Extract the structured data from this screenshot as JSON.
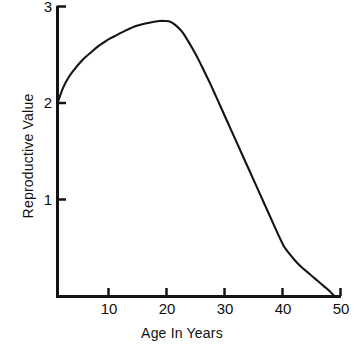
{
  "chart_data": {
    "type": "line",
    "title": "",
    "xlabel": "Age In Years",
    "ylabel": "Reproductive Value",
    "xlim": [
      0,
      50
    ],
    "ylim": [
      0,
      3
    ],
    "xticks": [
      10,
      20,
      30,
      40,
      50
    ],
    "xtick_labels": [
      "10",
      "20",
      "30",
      "40",
      "50"
    ],
    "yticks": [
      1,
      2,
      3
    ],
    "ytick_labels": [
      "1",
      "2",
      "3"
    ],
    "grid": false,
    "legend": null,
    "line_color": "#141414",
    "series": [
      {
        "name": "Reproductive Value",
        "x": [
          0,
          1,
          2,
          3,
          4,
          5,
          6,
          7,
          8,
          9,
          10,
          12,
          14,
          16,
          18,
          19,
          20,
          21,
          22,
          23,
          24,
          25,
          26,
          27,
          28,
          29,
          30,
          31,
          32,
          33,
          34,
          35,
          36,
          37,
          38,
          39,
          40,
          41,
          42,
          43,
          44,
          45,
          46,
          47,
          48,
          49
        ],
        "y": [
          2.0,
          2.16,
          2.27,
          2.35,
          2.42,
          2.48,
          2.53,
          2.58,
          2.62,
          2.66,
          2.69,
          2.75,
          2.8,
          2.83,
          2.85,
          2.85,
          2.84,
          2.8,
          2.74,
          2.65,
          2.55,
          2.44,
          2.32,
          2.2,
          2.07,
          1.94,
          1.81,
          1.68,
          1.55,
          1.42,
          1.29,
          1.16,
          1.03,
          0.9,
          0.77,
          0.64,
          0.52,
          0.44,
          0.37,
          0.31,
          0.26,
          0.21,
          0.16,
          0.11,
          0.06,
          0.0
        ]
      }
    ],
    "annotations": {
      "peak_age": 18,
      "peak_value": 2.85,
      "start_value": 2.0,
      "zero_age": 49
    }
  },
  "axes": {
    "x_axis_name": "age-axis",
    "y_axis_name": "reproductive-value-axis"
  }
}
